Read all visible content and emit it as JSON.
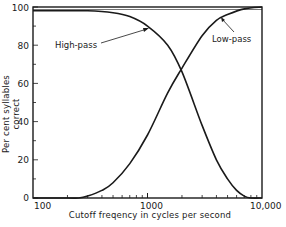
{
  "chart_data": {
    "type": "line",
    "title": "",
    "xlabel": "Cutoff freqency in cycles per second",
    "ylabel": "Per cent syllables correct",
    "xscale": "log",
    "xlim": [
      100,
      10000
    ],
    "ylim": [
      0,
      100
    ],
    "grid": false,
    "legend": "none (inline annotations)",
    "x_tick_labels": [
      "100",
      "1000",
      "10,000"
    ],
    "y_tick_labels": [
      "0",
      "20",
      "40",
      "60",
      "80",
      "100"
    ],
    "annotations": [
      "High-pass",
      "Low-pass"
    ],
    "series": [
      {
        "name": "High-pass",
        "x": [
          100,
          200,
          300,
          500,
          700,
          1000,
          1500,
          2000,
          3000,
          4000,
          5000,
          6000,
          7000,
          8000,
          10000
        ],
        "values": [
          98,
          98,
          98,
          97,
          95,
          90,
          80,
          66,
          38,
          20,
          10,
          4,
          1,
          0,
          0
        ]
      },
      {
        "name": "Low-pass",
        "x": [
          100,
          200,
          250,
          300,
          400,
          500,
          700,
          1000,
          1500,
          2000,
          3000,
          4000,
          5000,
          7000,
          10000
        ],
        "values": [
          0,
          0,
          0,
          1,
          4,
          8,
          18,
          33,
          55,
          68,
          85,
          93,
          96,
          99,
          100
        ]
      }
    ]
  },
  "axes": {
    "xlabel": "Cutoff freqency in cycles per second",
    "ylabel": "Per cent syllables correct",
    "x_ticks": [
      "100",
      "1000",
      "10,000"
    ],
    "y_ticks": [
      "0",
      "20",
      "40",
      "60",
      "80",
      "100"
    ]
  },
  "labels": {
    "high_pass": "High-pass",
    "low_pass": "Low-pass"
  },
  "colors": {
    "line": "#1a1a1a",
    "background": "#ffffff"
  }
}
